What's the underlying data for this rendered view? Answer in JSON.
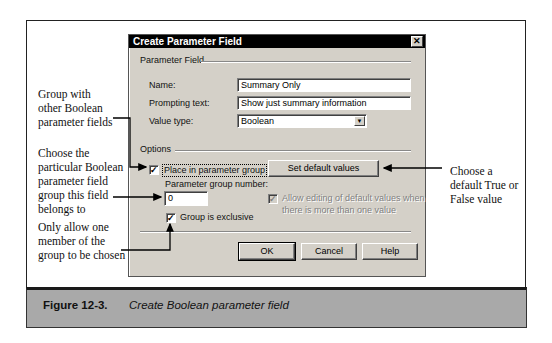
{
  "dialog": {
    "title": "Create Parameter Field",
    "close_icon": "close-icon",
    "parameter_field_group_label": "Parameter Field",
    "name_label": "Name:",
    "name_value": "Summary Only",
    "prompting_text_label": "Prompting text:",
    "prompting_text_value": "Show just summary information",
    "value_type_label": "Value type:",
    "value_type_selected": "Boolean",
    "options_group_label": "Options",
    "place_in_group_label": "Place in parameter group",
    "place_in_group_checked": true,
    "set_default_values_label": "Set default values",
    "group_number_label": "Parameter group number:",
    "group_number_value": "0",
    "allow_editing_label_line1": "Allow editing of default values when",
    "allow_editing_label_line2": "there is more than one value",
    "allow_editing_checked": true,
    "allow_editing_disabled": true,
    "group_exclusive_label": "Group is exclusive",
    "group_exclusive_checked": true,
    "ok_label": "OK",
    "cancel_label": "Cancel",
    "help_label": "Help",
    "check_glyph": "✓",
    "close_glyph": "✕",
    "dropdown_glyph": "▼"
  },
  "annotations": {
    "group_with": [
      "Group with",
      "other Boolean",
      "parameter fields"
    ],
    "choose_group": [
      "Choose the",
      "particular Boolean",
      "parameter field",
      "group this field",
      "belongs to"
    ],
    "exclusive": [
      "Only allow one",
      "member of the",
      "group to be chosen"
    ],
    "default_value": [
      "Choose a",
      "default True or",
      "False value"
    ]
  },
  "caption": {
    "number": "Figure 12-3.",
    "text": "Create Boolean parameter field"
  }
}
